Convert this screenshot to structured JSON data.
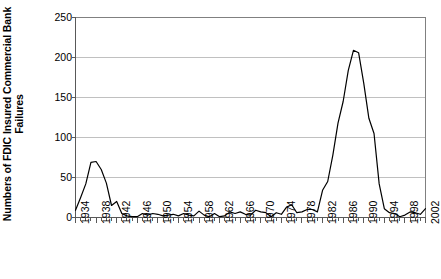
{
  "chart_data": {
    "type": "line",
    "title": "",
    "subtitle": "",
    "xlabel": "",
    "ylabel": "Numbers of FDIC Insured Commercial Bank Failures",
    "ylabel_line1": "Numbers of FDIC Insured Commercial Bank",
    "ylabel_line2": "Failures",
    "xlim": [
      1934,
      2002
    ],
    "ylim": [
      0,
      250
    ],
    "ytick_labels": [
      "250",
      "200",
      "150",
      "100",
      "50",
      "0"
    ],
    "ytick_values": [
      250,
      200,
      150,
      100,
      50,
      0
    ],
    "xtick_labels": [
      "1934",
      "1938",
      "1942",
      "1946",
      "1950",
      "1954",
      "1958",
      "1962",
      "1966",
      "1970",
      "1974",
      "1978",
      "1982",
      "1986",
      "1990",
      "1994",
      "1998",
      "2002"
    ],
    "xtick_values": [
      1934,
      1938,
      1942,
      1946,
      1950,
      1954,
      1958,
      1962,
      1966,
      1970,
      1974,
      1978,
      1982,
      1986,
      1990,
      1994,
      1998,
      2002
    ],
    "xtick_step": 4,
    "minor_xtick_step": 1,
    "grid": "horizontal",
    "grid_color": "#c0c0c0",
    "legend": "none",
    "line_color": "#000000",
    "line_width": 1.2,
    "markers": "none",
    "plot_bg": "#ffffff",
    "axis_color": "#808080",
    "x": [
      1934,
      1935,
      1936,
      1937,
      1938,
      1939,
      1940,
      1941,
      1942,
      1943,
      1944,
      1945,
      1946,
      1947,
      1948,
      1949,
      1950,
      1951,
      1952,
      1953,
      1954,
      1955,
      1956,
      1957,
      1958,
      1959,
      1960,
      1961,
      1962,
      1963,
      1964,
      1965,
      1966,
      1967,
      1968,
      1969,
      1970,
      1971,
      1972,
      1973,
      1974,
      1975,
      1976,
      1977,
      1978,
      1979,
      1980,
      1981,
      1982,
      1983,
      1984,
      1985,
      1986,
      1987,
      1988,
      1989,
      1990,
      1991,
      1992,
      1993,
      1994,
      1995,
      1996,
      1997,
      1998,
      1999,
      2000,
      2001,
      2002
    ],
    "values": [
      9,
      25,
      42,
      69,
      70,
      60,
      43,
      15,
      20,
      5,
      2,
      1,
      1,
      5,
      3,
      5,
      4,
      2,
      3,
      4,
      2,
      5,
      3,
      2,
      8,
      3,
      1,
      5,
      1,
      2,
      7,
      5,
      7,
      4,
      3,
      9,
      7,
      6,
      1,
      6,
      4,
      13,
      16,
      6,
      7,
      10,
      10,
      7,
      34,
      45,
      78,
      118,
      145,
      184,
      209,
      206,
      168,
      124,
      105,
      42,
      11,
      6,
      5,
      1,
      3,
      7,
      6,
      4,
      11
    ],
    "series": [
      {
        "name": "FDIC Insured Commercial Bank Failures",
        "values": [
          9,
          25,
          42,
          69,
          70,
          60,
          43,
          15,
          20,
          5,
          2,
          1,
          1,
          5,
          3,
          5,
          4,
          2,
          3,
          4,
          2,
          5,
          3,
          2,
          8,
          3,
          1,
          5,
          1,
          2,
          7,
          5,
          7,
          4,
          3,
          9,
          7,
          6,
          1,
          6,
          4,
          13,
          16,
          6,
          7,
          10,
          10,
          7,
          34,
          45,
          78,
          118,
          145,
          184,
          209,
          206,
          168,
          124,
          105,
          42,
          11,
          6,
          5,
          1,
          3,
          7,
          6,
          4,
          11
        ]
      }
    ]
  }
}
